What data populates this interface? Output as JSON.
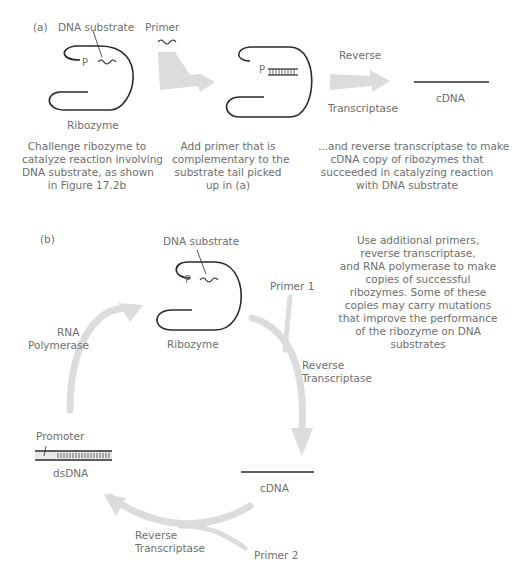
{
  "panel_a": {
    "label": "(a)",
    "dna_substrate_label": "DNA substrate",
    "primer_label": "Primer",
    "p_label": "P",
    "p_label_2": "P",
    "ribozyme_label": "Ribozyme",
    "rt_top": "Reverse",
    "rt_bottom": "Transcriptase",
    "cdna_label": "cDNA",
    "step1": [
      "Challenge ribozyme to",
      "catalyze reaction involving",
      "DNA substrate, as shown",
      "in Figure 17.2b"
    ],
    "step2": [
      "Add primer that is",
      "complementary to the",
      "substrate tail picked",
      "up in (a)"
    ],
    "step3": [
      "...and reverse transcriptase to make",
      "cDNA copy of ribozymes that",
      "succeeded in catalyzing reaction",
      "with DNA substrate"
    ]
  },
  "panel_b": {
    "label": "(b)",
    "dna_substrate_label": "DNA substrate",
    "p_label": "P",
    "ribozyme_label": "Ribozyme",
    "primer1_label": "Primer 1",
    "rt1_top": "Reverse",
    "rt1_bottom": "Transcriptase",
    "cdna_label": "cDNA",
    "primer2_label": "Primer 2",
    "rt2_top": "Reverse",
    "rt2_bottom": "Transcriptase",
    "promoter_label": "Promoter",
    "dsdna_label": "dsDNA",
    "rnapol_top": "RNA",
    "rnapol_bottom": "Polymerase",
    "description": [
      "Use additional primers,",
      "reverse transcriptase,",
      "and RNA polymerase to make",
      "copies of successful",
      "ribozymes. Some of these",
      "copies may carry mutations",
      "that improve the performance",
      "of the ribozyme on DNA",
      "substrates"
    ]
  },
  "colors": {
    "line": "#2a2a2a",
    "arrow": "#dcdcdc",
    "text": "#6e6e6e"
  }
}
